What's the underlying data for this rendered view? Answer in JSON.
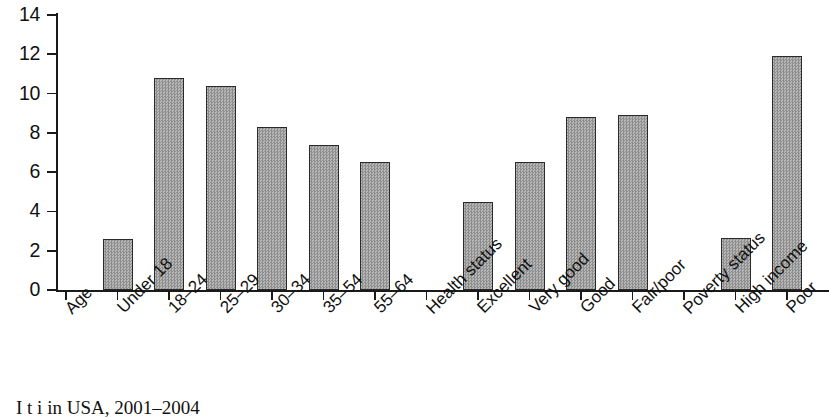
{
  "chart_data": {
    "type": "bar",
    "title": "",
    "xlabel": "",
    "ylabel": "",
    "ylim": [
      0,
      14
    ],
    "ytick_values": [
      0,
      2,
      4,
      6,
      8,
      10,
      12,
      14
    ],
    "ytick_labels": [
      "0",
      "2",
      "4",
      "6",
      "8",
      "10",
      "12",
      "14"
    ],
    "grid": false,
    "legend": false,
    "group_headers": [
      "Age",
      "Health status",
      "Poverty status"
    ],
    "categories": [
      "Age",
      "Under 18",
      "18–24",
      "25–29",
      "30–34",
      "35–54",
      "55–64",
      "Health status",
      "Excellent",
      "Very good",
      "Good",
      "Fair/poor",
      "Poverty status",
      "High income",
      "Poor"
    ],
    "values": [
      null,
      2.6,
      10.8,
      10.4,
      8.3,
      7.4,
      6.5,
      null,
      4.5,
      6.5,
      8.8,
      8.9,
      null,
      2.65,
      11.9
    ],
    "bar_color": "#a8a8a8",
    "bar_edge_color": "#2a2a2a"
  },
  "caption": {
    "text": "I t i in USA, 2001–2004"
  }
}
